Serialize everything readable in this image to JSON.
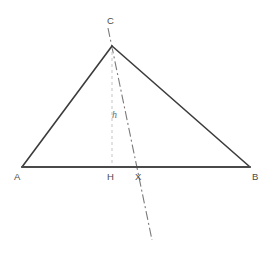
{
  "figure": {
    "type": "geometry-diagram",
    "width": 272,
    "height": 258,
    "background_color": "#ffffff"
  },
  "labels": {
    "apex": "C",
    "base_left": "A",
    "base_right": "B",
    "foot_of_altitude": "H",
    "cevian_intersection": "X",
    "altitude_measure": "h"
  },
  "points": {
    "A": {
      "x": 22,
      "y": 167
    },
    "B": {
      "x": 250,
      "y": 167
    },
    "C": {
      "x": 112,
      "y": 46
    },
    "H": {
      "x": 112,
      "y": 167
    },
    "X": {
      "x": 131,
      "y": 167
    },
    "cevian_top": {
      "x": 108,
      "y": 28
    },
    "cevian_bottom": {
      "x": 152,
      "y": 240
    }
  },
  "styles": {
    "triangle_stroke": "#3c3c3c",
    "triangle_stroke_width": 1.6,
    "base_stroke": "#4a4a4a",
    "base_stroke_width": 2,
    "altitude_stroke": "#cfcfcf",
    "altitude_stroke_width": 1.2,
    "altitude_dash": "3 3",
    "cevian_stroke": "#7a7a7a",
    "cevian_stroke_width": 1.1,
    "cevian_dash": "9 3 2 3",
    "label_color": "#4a4a4a",
    "measure_label_color": "#6b6b6b"
  }
}
